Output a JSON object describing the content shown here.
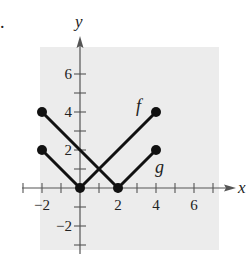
{
  "figure_label": ".",
  "chart_data": {
    "type": "line",
    "title": "",
    "xlabel": "x",
    "ylabel": "y",
    "xlim": [
      -3,
      7
    ],
    "ylim": [
      -3,
      7
    ],
    "grid": false,
    "background": "#ececec",
    "x_tick_labels": [
      "-2",
      "2",
      "4",
      "6"
    ],
    "x_tick_values": [
      -2,
      2,
      4,
      6
    ],
    "y_tick_labels": [
      "-2",
      "2",
      "4",
      "6"
    ],
    "y_tick_values": [
      -2,
      2,
      4,
      6
    ],
    "series": [
      {
        "name": "f",
        "points": [
          [
            -2,
            2
          ],
          [
            0,
            0
          ],
          [
            4,
            4
          ]
        ],
        "endpoints_closed": true,
        "label_pos": [
          2.95,
          4.0
        ]
      },
      {
        "name": "g",
        "points": [
          [
            -2,
            4
          ],
          [
            2,
            0
          ],
          [
            4,
            2
          ]
        ],
        "endpoints_closed": true,
        "label_pos": [
          3.95,
          0.8
        ]
      }
    ]
  }
}
